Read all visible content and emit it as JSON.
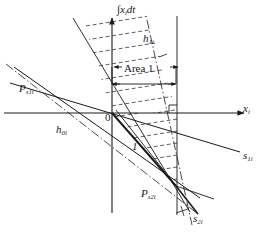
{
  "figure": {
    "type": "technical-line-diagram",
    "background": "#ffffff",
    "stroke_color": "#1a1a1a",
    "width": 269,
    "height": 240
  },
  "axes": {
    "x_axis": {
      "label": "x",
      "subscript": "i",
      "y_pixel": 113,
      "x_start": 4,
      "x_end": 248,
      "arrow": true
    },
    "y_axis": {
      "label": "∫x",
      "subscript": "i",
      "suffix": "dt",
      "x_pixel": 112,
      "y_start": 17,
      "y_end": 213,
      "arrow": true
    }
  },
  "labels": [
    {
      "name": "y-axis-label",
      "text_integral": "∫x",
      "sub": "i",
      "tail": "dt"
    },
    {
      "name": "x-axis-label",
      "text": "x",
      "sub": "i"
    },
    {
      "name": "h1i-label",
      "text": "h",
      "sub": "1i"
    },
    {
      "name": "area1-label",
      "text": "Area 1"
    },
    {
      "name": "ps1i-label",
      "text": "P",
      "sub": "s1i"
    },
    {
      "name": "h0i-label",
      "text": "h",
      "sub": "0i"
    },
    {
      "name": "origin-label",
      "text": "0"
    },
    {
      "name": "one-label",
      "text": "1"
    },
    {
      "name": "s1i-label",
      "text": "s",
      "sub": "1i"
    },
    {
      "name": "ps2i-label",
      "text": "P",
      "sub": "s2i"
    },
    {
      "name": "s2i-label",
      "text": "s",
      "sub": "2i"
    }
  ],
  "text": {
    "y_axis_integral": "∫x",
    "y_axis_sub": "i",
    "y_axis_tail": "dt",
    "x_axis_main": "x",
    "x_axis_sub": "i",
    "h1i_main": "h",
    "h1i_sub": "1i",
    "area1": "Area 1",
    "ps1i_main": "P",
    "ps1i_sub": "s1i",
    "h0i_main": "h",
    "h0i_sub": "0i",
    "origin": "0",
    "one": "1",
    "s1i_main": "s",
    "s1i_sub": "1i",
    "ps2i_main": "P",
    "ps2i_sub": "s2i",
    "s2i_main": "s",
    "s2i_sub": "2i"
  },
  "points": {
    "origin": {
      "x": 112,
      "y": 113
    },
    "P_s1i": {
      "x": 40,
      "y": 78
    },
    "P_s2i": {
      "x": 176,
      "y": 186
    },
    "right_angle_corner": {
      "x": 177,
      "y": 113
    }
  },
  "annotations": {
    "right_angle_marker": true,
    "hatching": "dashed parallel lines",
    "area1_arrows": "double-headed horizontal measure"
  }
}
